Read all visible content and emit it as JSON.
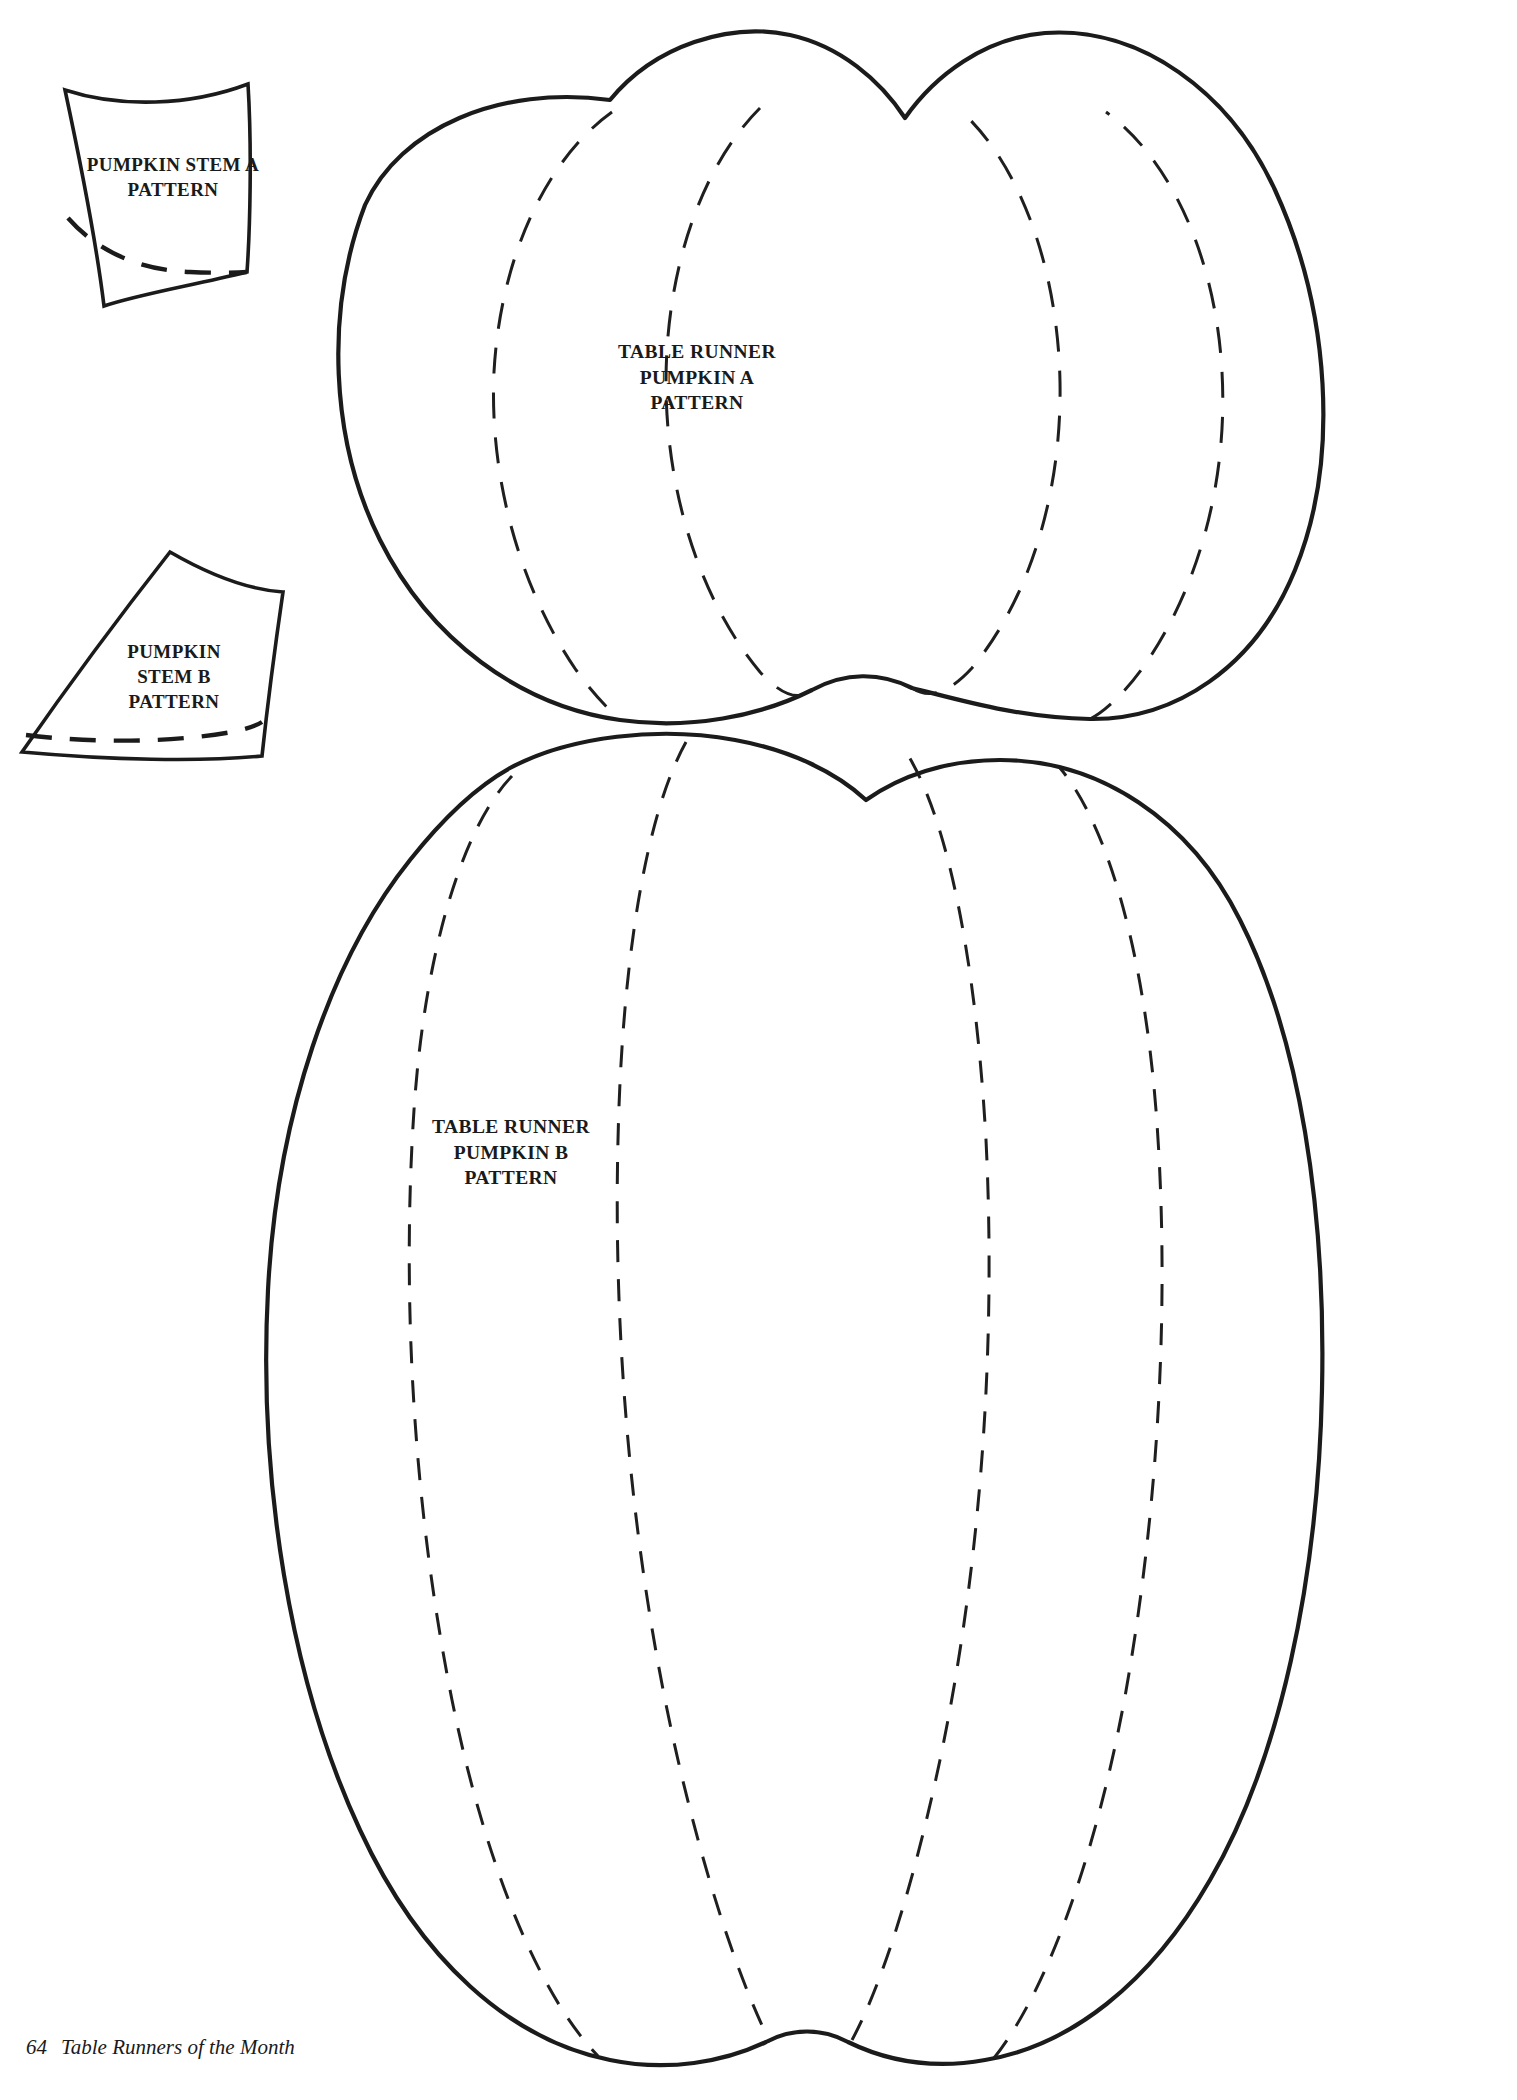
{
  "page": {
    "width": 1517,
    "height": 2100,
    "background_color": "#ffffff",
    "ink_color": "#1b1b1b",
    "document_type": "sewing-pattern-template-page"
  },
  "labels": {
    "stem_a": "PUMPKIN STEM A\nPATTERN",
    "stem_b": "PUMPKIN\nSTEM B\nPATTERN",
    "pumpkin_a": "TABLE RUNNER\nPUMPKIN A\nPATTERN",
    "pumpkin_b": "TABLE RUNNER\nPUMPKIN B\nPATTERN"
  },
  "footer": {
    "page_number": "64",
    "book_title": "Table Runners of the Month"
  },
  "pieces": [
    {
      "id": "pumpkin-stem-a",
      "label": "PUMPKIN STEM A PATTERN",
      "shape": "quadrilateral-with-curved-edges",
      "has_dashed_seam_line": true
    },
    {
      "id": "pumpkin-stem-b",
      "label": "PUMPKIN STEM B PATTERN",
      "shape": "tapered-wedge-with-curved-edges",
      "has_dashed_seam_line": true
    },
    {
      "id": "table-runner-pumpkin-a",
      "label": "TABLE RUNNER PUMPKIN A PATTERN",
      "shape": "wide-pumpkin-body",
      "dashed_rib_count": 4
    },
    {
      "id": "table-runner-pumpkin-b",
      "label": "TABLE RUNNER PUMPKIN B PATTERN",
      "shape": "tall-pumpkin-body",
      "dashed_rib_count": 4
    }
  ]
}
